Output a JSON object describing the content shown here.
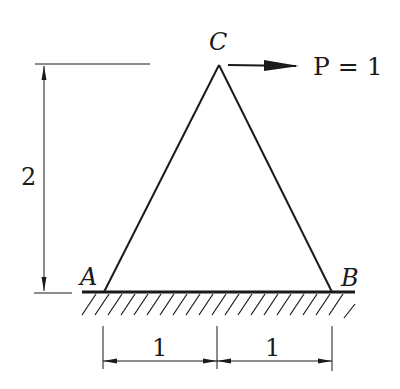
{
  "diagram": {
    "type": "truss",
    "nodes": {
      "A": {
        "label": "A",
        "support": "ground"
      },
      "B": {
        "label": "B",
        "support": "ground"
      },
      "C": {
        "label": "C"
      }
    },
    "members": [
      [
        "A",
        "C"
      ],
      [
        "C",
        "B"
      ]
    ],
    "load": {
      "node": "C",
      "direction": "right",
      "label": "P = 1"
    },
    "dimensions": {
      "height": "2",
      "left_span": "1",
      "right_span": "1"
    },
    "colors": {
      "line": "#1a1a1a",
      "background": "#ffffff"
    }
  }
}
